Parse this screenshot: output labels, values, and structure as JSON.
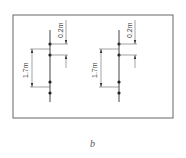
{
  "diagram": {
    "caption": "b",
    "columns": [
      {
        "spacing_top_label": "0.2m",
        "spacing_main_label": "1.7m"
      },
      {
        "spacing_top_label": "0.2m",
        "spacing_main_label": "1.7m"
      }
    ],
    "colors": {
      "line": "#444444",
      "frame": "#666666",
      "dot": "#222222"
    }
  }
}
